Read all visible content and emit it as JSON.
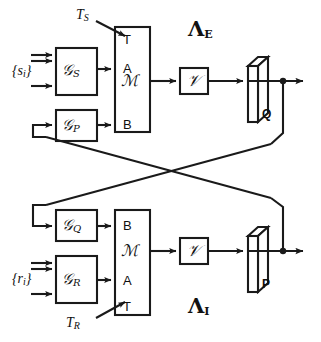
{
  "diagram": {
    "title_upper": "Λ",
    "title_upper_sub": "E",
    "title_lower": "Λ",
    "title_lower_sub": "I",
    "upper_branch": {
      "input_set_label": "{s",
      "input_set_sub": "i",
      "input_set_close": "}",
      "trigger_label": "T",
      "trigger_sub": "S",
      "gain_s": "𝒢",
      "gain_s_sub": "S",
      "gain_p": "𝒢",
      "gain_p_sub": "P",
      "stack_rows": [
        "T",
        "A",
        "ℳ",
        "B"
      ],
      "v_block": "𝒱",
      "slab_label": "Q"
    },
    "lower_branch": {
      "input_set_label": "{r",
      "input_set_sub": "i",
      "input_set_close": "}",
      "trigger_label": "T",
      "trigger_sub": "R",
      "gain_q": "𝒢",
      "gain_q_sub": "Q",
      "gain_r": "𝒢",
      "gain_r_sub": "R",
      "stack_rows": [
        "B",
        "ℳ",
        "A",
        "T"
      ],
      "v_block": "𝒱",
      "slab_label": "P"
    },
    "colors": {
      "line": "#1a1a1a",
      "background": "#ffffff",
      "slab_face": "#ffffff",
      "slab_top": "#ffffff"
    }
  }
}
